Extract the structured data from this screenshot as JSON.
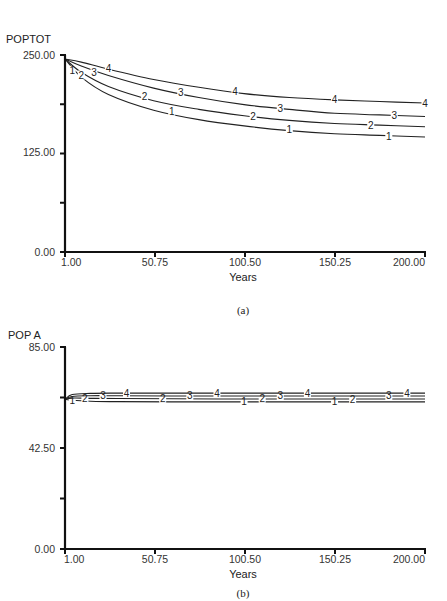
{
  "chart_data": [
    {
      "id": "a",
      "type": "line",
      "title": "POPTOT",
      "caption": "(a)",
      "xlabel": "Years",
      "ylabel": "POPTOT",
      "xlim": [
        1.0,
        200.0
      ],
      "ylim": [
        0.0,
        250.0
      ],
      "x_ticks": [
        "1.00",
        "50.75",
        "100.50",
        "150.25",
        "200.00"
      ],
      "y_tick_labels": [
        "250.00",
        "125.00",
        "0.00"
      ],
      "y_ticks_minor": [
        187.5,
        62.5
      ],
      "grid": false,
      "x": [
        1,
        10,
        25,
        50,
        75,
        100,
        125,
        150,
        175,
        200
      ],
      "series": [
        {
          "name": "1",
          "values": [
            245,
            222,
            200,
            180,
            168,
            160,
            154,
            150,
            148,
            146
          ]
        },
        {
          "name": "2",
          "values": [
            245,
            228,
            210,
            192,
            181,
            173,
            167,
            163,
            161,
            159
          ]
        },
        {
          "name": "3",
          "values": [
            245,
            236,
            224,
            208,
            196,
            187,
            181,
            176,
            174,
            172
          ]
        },
        {
          "name": "4",
          "values": [
            245,
            241,
            232,
            219,
            209,
            201,
            196,
            193,
            191,
            189
          ]
        }
      ],
      "markers": {
        "1": [
          [
            5,
            230
          ],
          [
            60,
            178
          ],
          [
            125,
            155
          ],
          [
            180,
            147
          ]
        ],
        "2": [
          [
            10,
            224
          ],
          [
            45,
            197
          ],
          [
            105,
            172
          ],
          [
            170,
            161
          ]
        ],
        "3": [
          [
            17,
            228
          ],
          [
            65,
            203
          ],
          [
            120,
            182
          ],
          [
            183,
            173
          ]
        ],
        "4": [
          [
            25,
            233
          ],
          [
            95,
            204
          ],
          [
            150,
            194
          ],
          [
            200,
            189
          ]
        ]
      }
    },
    {
      "id": "b",
      "type": "line",
      "title": "POP A",
      "caption": "(b)",
      "xlabel": "Years",
      "ylabel": "POP A",
      "xlim": [
        1.0,
        200.0
      ],
      "ylim": [
        0.0,
        85.0
      ],
      "x_ticks": [
        "1.00",
        "50.75",
        "100.50",
        "150.25",
        "200.00"
      ],
      "y_tick_labels": [
        "85.00",
        "42.50",
        "0.00"
      ],
      "y_ticks_minor": [
        63.75,
        21.25
      ],
      "grid": false,
      "x": [
        1,
        5,
        15,
        30,
        60,
        100,
        140,
        200
      ],
      "series": [
        {
          "name": "1",
          "values": [
            63.0,
            62.6,
            62.2,
            62.0,
            61.9,
            61.9,
            61.9,
            61.9
          ]
        },
        {
          "name": "2",
          "values": [
            63.0,
            63.5,
            63.4,
            63.3,
            63.2,
            63.1,
            63.1,
            63.1
          ]
        },
        {
          "name": "3",
          "values": [
            63.0,
            64.2,
            64.5,
            64.5,
            64.4,
            64.4,
            64.4,
            64.4
          ]
        },
        {
          "name": "4",
          "values": [
            63.0,
            65.0,
            65.5,
            65.6,
            65.6,
            65.6,
            65.6,
            65.6
          ]
        }
      ],
      "markers": {
        "1": [
          [
            5,
            62.6
          ],
          [
            100,
            61.9
          ],
          [
            150,
            61.9
          ]
        ],
        "2": [
          [
            12,
            63.4
          ],
          [
            55,
            63.2
          ],
          [
            110,
            63.2
          ],
          [
            160,
            63.1
          ]
        ],
        "3": [
          [
            22,
            64.5
          ],
          [
            70,
            64.4
          ],
          [
            120,
            64.4
          ],
          [
            180,
            64.4
          ]
        ],
        "4": [
          [
            35,
            65.6
          ],
          [
            85,
            65.6
          ],
          [
            135,
            65.6
          ],
          [
            190,
            65.6
          ]
        ]
      }
    }
  ]
}
